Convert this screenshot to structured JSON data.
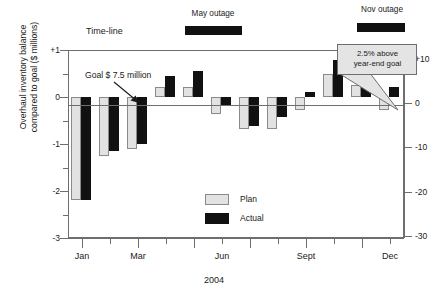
{
  "chart_data": {
    "type": "bar",
    "title": "",
    "subtitle": "",
    "xlabel": "2004",
    "ylabel": "Overhaul inventory balance\ncompared to goal ($ millions)",
    "ylabel_right": "",
    "categories": [
      "Jan",
      "Feb",
      "Mar",
      "Apr",
      "May",
      "Jun",
      "Jul",
      "Aug",
      "Sept",
      "Oct",
      "Nov",
      "Dec"
    ],
    "visible_tick_labels": [
      "Jan",
      "Mar",
      "Jun",
      "Sept",
      "Dec"
    ],
    "series": [
      {
        "name": "Plan",
        "color": "#e2e2e2",
        "values": [
          -2.2,
          -1.25,
          -1.1,
          0.22,
          0.22,
          -0.37,
          -0.68,
          -0.68,
          -0.28,
          0.48,
          0.25,
          -0.27
        ]
      },
      {
        "name": "Actual",
        "color": "#111111",
        "values": [
          -2.2,
          -1.15,
          -1.0,
          0.45,
          0.55,
          -0.17,
          -0.62,
          -0.42,
          0.1,
          0.78,
          0.5,
          0.22
        ]
      }
    ],
    "ylim": [
      -3,
      1
    ],
    "yticks": [
      "+1",
      "0",
      "-1",
      "-2",
      "-3"
    ],
    "ytick_values": [
      1,
      0,
      -1,
      -2,
      -3
    ],
    "yminor_values": [
      0.5,
      -0.5,
      -1.5,
      -2.5
    ],
    "ylim_right": [
      -30.5,
      12.0
    ],
    "yticks_right": [
      "+10",
      "0",
      "-10",
      "-20",
      "-30"
    ],
    "ytick_values_right": [
      10,
      0,
      -10,
      -20,
      -30
    ],
    "grid": false,
    "legend_position": "inside-bottom-center",
    "annotations": [
      {
        "text": "Time-line",
        "type": "label"
      },
      {
        "text": "May outage",
        "type": "outage-label"
      },
      {
        "text": "Nov outage",
        "type": "outage-label"
      },
      {
        "text": "Goal $ 7.5 million",
        "type": "arrow-annotation"
      },
      {
        "text": "2.5% above year-end goal",
        "type": "callout"
      }
    ]
  },
  "axis": {
    "y_title": "Overhaul inventory balance\ncompared to goal ($ millions)",
    "x_title": "2004",
    "left_labels": [
      "+1",
      "0",
      "-1",
      "-2",
      "-3"
    ],
    "right_labels": [
      "+10",
      "0",
      "-10",
      "-20",
      "-30"
    ],
    "x_labels": [
      "Jan",
      "Mar",
      "Jun",
      "Sept",
      "Dec"
    ]
  },
  "legend": {
    "items": [
      {
        "label": "Plan",
        "color": "#e2e2e2"
      },
      {
        "label": "Actual",
        "color": "#111111"
      }
    ]
  },
  "annotations": {
    "timeline_label": "Time-line",
    "may_outage_label": "May outage",
    "nov_outage_label": "Nov outage",
    "goal_label": "Goal $ 7.5 million",
    "callout_line1": "2.5% above",
    "callout_line2": "year-end goal"
  }
}
